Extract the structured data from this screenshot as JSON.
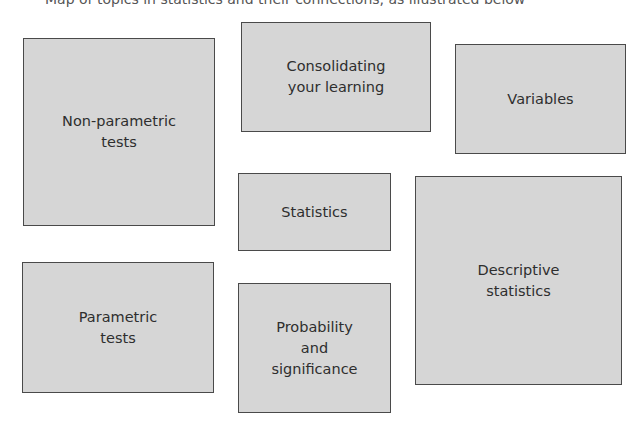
{
  "caption": "Map of topics in statistics and their connections, as illustrated below",
  "boxes": [
    {
      "id": "non-parametric-tests",
      "label": "Non-parametric\ntests"
    },
    {
      "id": "consolidating-your-learning",
      "label": "Consolidating\nyour learning"
    },
    {
      "id": "variables",
      "label": "Variables"
    },
    {
      "id": "statistics",
      "label": "Statistics"
    },
    {
      "id": "descriptive-statistics",
      "label": "Descriptive\nstatistics"
    },
    {
      "id": "parametric-tests",
      "label": "Parametric\ntests"
    },
    {
      "id": "probability-and-significance",
      "label": "Probability\nand\nsignificance"
    }
  ],
  "colors": {
    "box_fill": "#d6d6d6",
    "box_border": "#4a4a4a",
    "text": "#2e2e2e"
  }
}
